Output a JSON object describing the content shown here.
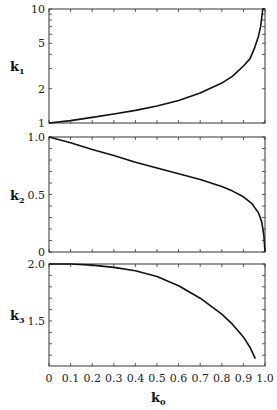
{
  "chart_data": [
    {
      "type": "line",
      "panel": "top",
      "ylabel": "k",
      "ylabel_sub": "1",
      "yscale": "log",
      "ylim": [
        1,
        10
      ],
      "yticks": [
        1,
        2,
        5,
        10
      ],
      "ytick_labels": [
        "1",
        "2",
        "5",
        "10"
      ],
      "x": [
        0,
        0.1,
        0.2,
        0.3,
        0.4,
        0.5,
        0.6,
        0.7,
        0.8,
        0.85,
        0.9,
        0.93,
        0.95,
        0.97,
        0.98,
        0.99,
        1.0
      ],
      "values": [
        1.0,
        1.05,
        1.12,
        1.2,
        1.29,
        1.41,
        1.58,
        1.83,
        2.24,
        2.58,
        3.16,
        3.65,
        4.47,
        5.77,
        7.07,
        10.0,
        10.0
      ]
    },
    {
      "type": "line",
      "panel": "middle",
      "ylabel": "k",
      "ylabel_sub": "2",
      "yscale": "linear",
      "ylim": [
        0,
        1.0
      ],
      "yticks": [
        0,
        0.5,
        1.0
      ],
      "ytick_labels": [
        "0",
        "0.5",
        "1.0"
      ],
      "x": [
        0,
        0.1,
        0.2,
        0.3,
        0.4,
        0.5,
        0.6,
        0.7,
        0.8,
        0.85,
        0.9,
        0.94,
        0.97,
        0.985,
        0.995,
        1.0
      ],
      "values": [
        1.0,
        0.95,
        0.89,
        0.84,
        0.78,
        0.73,
        0.68,
        0.63,
        0.57,
        0.53,
        0.48,
        0.42,
        0.34,
        0.26,
        0.14,
        0.0
      ]
    },
    {
      "type": "line",
      "panel": "bottom",
      "ylabel": "k",
      "ylabel_sub": "3",
      "yscale": "linear",
      "ylim": [
        1.105,
        2.0
      ],
      "yticks": [
        1.5,
        2.0
      ],
      "ytick_labels": [
        "1.5",
        "2.0"
      ],
      "x": [
        0,
        0.1,
        0.2,
        0.3,
        0.4,
        0.5,
        0.6,
        0.7,
        0.8,
        0.85,
        0.9,
        0.93,
        0.955
      ],
      "values": [
        2.0,
        2.0,
        1.99,
        1.97,
        1.94,
        1.89,
        1.81,
        1.7,
        1.56,
        1.47,
        1.36,
        1.27,
        1.17
      ]
    }
  ],
  "xaxis": {
    "label": "k",
    "label_sub": "0",
    "xlim": [
      0,
      1.0
    ],
    "ticks": [
      0,
      0.1,
      0.2,
      0.3,
      0.4,
      0.5,
      0.6,
      0.7,
      0.8,
      0.9,
      1.0
    ],
    "tick_labels": [
      "0",
      "0.1",
      "0.2",
      "0.3",
      "0.4",
      "0.5",
      "0.6",
      "0.7",
      "0.8",
      "0.9",
      "1.0"
    ]
  },
  "colors": {
    "line": "#111111",
    "frame": "#333333",
    "background": "#ffffff"
  }
}
